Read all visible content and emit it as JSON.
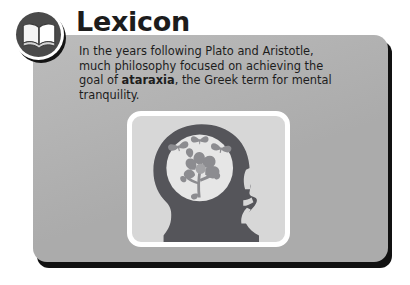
{
  "card": {
    "background_color": "#b4b4b4",
    "shadow_color": "#111111"
  },
  "header": {
    "badge_icon": "open-book-icon",
    "badge_disc_color": "#4a4a4a",
    "title": "Lexicon",
    "title_color": "#1c1c1c"
  },
  "body": {
    "paragraph_part1": "In the years following Plato and Aristotle, much philosophy focused on achieving the goal of ",
    "emphasis_term": "ataraxia",
    "paragraph_part2": ", the Greek term for mental tranquility.",
    "text_color": "#1d1d1d"
  },
  "illustration": {
    "name": "head-with-flowers-and-butterflies",
    "frame_border_color": "#ffffff",
    "frame_background_color": "#d7d7d7",
    "silhouette_color": "#55555a",
    "mind_circle_color": "#e6e6e6",
    "flora_color": "#8c8c90",
    "butterfly_count": 3
  }
}
